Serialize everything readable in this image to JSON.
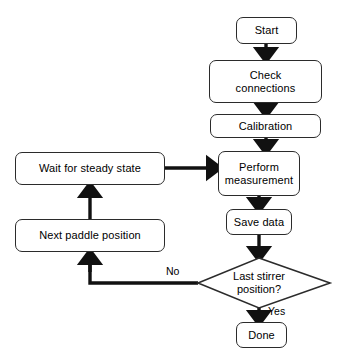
{
  "diagram": {
    "type": "flowchart",
    "orientation": "top-to-bottom with feedback loop",
    "background_color": "#ffffff",
    "line_color": "#000000",
    "node_border_color": "#2b2b2b",
    "nodes": {
      "start": {
        "label": "Start",
        "shape": "rounded-rectangle"
      },
      "check_connections": {
        "label": "Check\nconnections",
        "shape": "rounded-rectangle"
      },
      "calibration": {
        "label": "Calibration",
        "shape": "rounded-rectangle"
      },
      "perform_measurement": {
        "label": "Perform\nmeasurement",
        "shape": "rounded-rectangle"
      },
      "save_data": {
        "label": "Save data",
        "shape": "rounded-rectangle"
      },
      "decision": {
        "label": "Last stirrer\nposition?",
        "shape": "diamond"
      },
      "done": {
        "label": "Done",
        "shape": "rounded-rectangle"
      },
      "wait_steady": {
        "label": "Wait for steady state",
        "shape": "rounded-rectangle"
      },
      "next_paddle": {
        "label": "Next paddle position",
        "shape": "rounded-rectangle"
      }
    },
    "edge_labels": {
      "no": "No",
      "yes": "Yes"
    }
  }
}
